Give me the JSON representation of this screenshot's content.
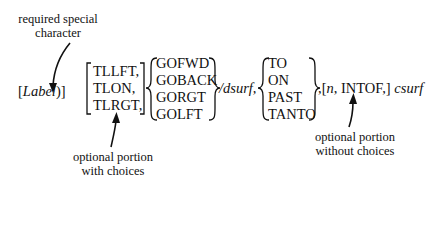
{
  "annotations": {
    "required": [
      "required special",
      "character"
    ],
    "optional_choices": [
      "optional portion",
      "with choices"
    ],
    "optional_no_choices": [
      "optional portion",
      "without choices"
    ]
  },
  "syntax": {
    "label_open": "[",
    "label": "Label",
    "label_close": ")]",
    "group1": [
      "TLLFT,",
      "TLON,",
      "TLRGT,"
    ],
    "group2": [
      "GOFWD",
      "GOBACK",
      "GORGT",
      "GOLFT"
    ],
    "slash": "/",
    "dsurf": "dsurf",
    "comma1": ",",
    "group3": [
      "TO",
      "ON",
      "PAST",
      "TANTO"
    ],
    "after_group3": ",[",
    "n": "n",
    "intof": ", INTOF,]",
    "csurf": "csurf"
  }
}
